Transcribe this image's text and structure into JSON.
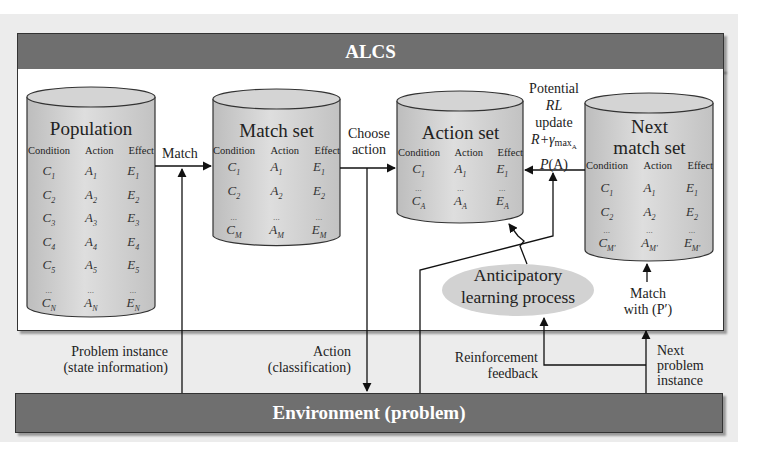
{
  "header": {
    "title": "ALCS"
  },
  "footer": {
    "title": "Environment (problem)"
  },
  "columns": [
    "Condition",
    "Action",
    "Effect"
  ],
  "population": {
    "title": "Population",
    "rows": [
      {
        "c": "C",
        "cs": "1",
        "a": "A",
        "as": "1",
        "e": "E",
        "es": "1"
      },
      {
        "c": "C",
        "cs": "2",
        "a": "A",
        "as": "2",
        "e": "E",
        "es": "2"
      },
      {
        "c": "C",
        "cs": "3",
        "a": "A",
        "as": "3",
        "e": "E",
        "es": "3"
      },
      {
        "c": "C",
        "cs": "4",
        "a": "A",
        "as": "4",
        "e": "E",
        "es": "4"
      },
      {
        "c": "C",
        "cs": "5",
        "a": "A",
        "as": "5",
        "e": "E",
        "es": "5"
      }
    ],
    "ellipsis": "...",
    "last": {
      "c": "C",
      "cs": "N",
      "a": "A",
      "as": "N",
      "e": "E",
      "es": "N"
    }
  },
  "match_set": {
    "title": "Match set",
    "rows": [
      {
        "c": "C",
        "cs": "1",
        "a": "A",
        "as": "1",
        "e": "E",
        "es": "1"
      },
      {
        "c": "C",
        "cs": "2",
        "a": "A",
        "as": "2",
        "e": "E",
        "es": "2"
      }
    ],
    "ellipsis": "...",
    "last": {
      "c": "C",
      "cs": "M",
      "a": "A",
      "as": "M",
      "e": "E",
      "es": "M"
    }
  },
  "action_set": {
    "title": "Action set",
    "rows": [
      {
        "c": "C",
        "cs": "1",
        "a": "A",
        "as": "1",
        "e": "E",
        "es": "1"
      }
    ],
    "ellipsis": "...",
    "last": {
      "c": "C",
      "cs": "A",
      "a": "A",
      "as": "A",
      "e": "E",
      "es": "A"
    }
  },
  "next_match_set": {
    "title_line1": "Next",
    "title_line2": "match set",
    "rows": [
      {
        "c": "C",
        "cs": "1",
        "a": "A",
        "as": "1",
        "e": "E",
        "es": "1"
      },
      {
        "c": "C",
        "cs": "2",
        "a": "A",
        "as": "2",
        "e": "E",
        "es": "2"
      }
    ],
    "ellipsis": "...",
    "last": {
      "c": "C",
      "cs": "M'",
      "a": "A",
      "as": "M'",
      "e": "E",
      "es": "M'"
    }
  },
  "labels": {
    "match": "Match",
    "choose_action_1": "Choose",
    "choose_action_2": "action",
    "rl_1": "Potential",
    "rl_2": "RL",
    "rl_3": "update",
    "rl_4": "R+γ",
    "rl_4_sub": "max",
    "rl_4_subsub": "A",
    "rl_5_p": "P",
    "rl_5_arg": "(A)",
    "alp_1": "Anticipatory",
    "alp_2": "learning process",
    "match_with_1": "Match",
    "match_with_2": "with (P′)",
    "problem_instance_1": "Problem instance",
    "problem_instance_2": "(state information)",
    "action_1": "Action",
    "action_2": "(classification)",
    "reinforcement_1": "Reinforcement",
    "reinforcement_2": "feedback",
    "next_problem_1": "Next",
    "next_problem_2": "problem",
    "next_problem_3": "instance"
  },
  "colors": {
    "bar": "#6f6f6f",
    "cylinder": "#cfcfcf",
    "ellipse": "#d2d2d2",
    "backdrop": "#ececec"
  }
}
